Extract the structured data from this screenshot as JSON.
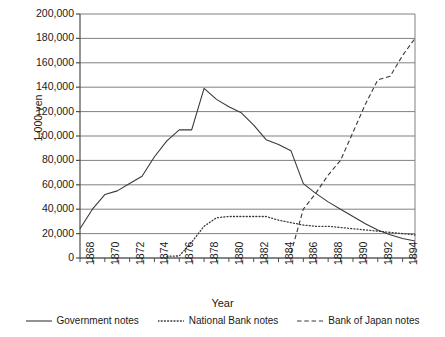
{
  "chart_data": {
    "type": "line",
    "title": "",
    "xlabel": "Year",
    "ylabel": "1,000 yen",
    "xlim": [
      1868,
      1895
    ],
    "ylim": [
      0,
      200000
    ],
    "ytick_labels": [
      "200,000",
      "180,000",
      "160,000",
      "140,000",
      "120,000",
      "100,000",
      "80,000",
      "60,000",
      "40,000",
      "20,000",
      "0"
    ],
    "ytick_values": [
      200000,
      180000,
      160000,
      140000,
      120000,
      100000,
      80000,
      60000,
      40000,
      20000,
      0
    ],
    "xtick_labels": [
      "1868",
      "1870",
      "1872",
      "1874",
      "1876",
      "1878",
      "1880",
      "1882",
      "1884",
      "1886",
      "1888",
      "1890",
      "1892",
      "1894"
    ],
    "xtick_values": [
      1868,
      1870,
      1872,
      1874,
      1876,
      1878,
      1880,
      1882,
      1884,
      1886,
      1888,
      1890,
      1892,
      1894
    ],
    "grid": "horizontal",
    "legend_position": "bottom",
    "x": [
      1868,
      1869,
      1870,
      1871,
      1872,
      1873,
      1874,
      1875,
      1876,
      1877,
      1878,
      1879,
      1880,
      1881,
      1882,
      1883,
      1884,
      1885,
      1886,
      1887,
      1888,
      1889,
      1890,
      1891,
      1892,
      1893,
      1894,
      1895
    ],
    "series": [
      {
        "name": "Government notes",
        "style": "solid",
        "color": "#3a3a3a",
        "values": [
          24000,
          40000,
          52000,
          55000,
          61000,
          67000,
          83000,
          96000,
          105000,
          105000,
          139000,
          130000,
          124000,
          119000,
          109000,
          97000,
          93000,
          88000,
          61000,
          53000,
          46000,
          40000,
          34000,
          28000,
          23000,
          19000,
          16000,
          14000
        ]
      },
      {
        "name": "National Bank notes",
        "style": "dotted",
        "color": "#3a3a3a",
        "values": [
          null,
          null,
          null,
          null,
          null,
          null,
          null,
          1400,
          1700,
          13000,
          26000,
          33000,
          34000,
          34000,
          34000,
          34000,
          31000,
          29000,
          27000,
          26000,
          26000,
          25000,
          24000,
          23000,
          22000,
          21000,
          20000,
          19000
        ]
      },
      {
        "name": "Bank of Japan notes",
        "style": "dashed",
        "color": "#3a3a3a",
        "values": [
          null,
          null,
          null,
          null,
          null,
          null,
          null,
          null,
          null,
          null,
          null,
          null,
          null,
          null,
          null,
          null,
          null,
          4000,
          40000,
          53000,
          68000,
          80000,
          103000,
          126000,
          146000,
          149000,
          166000,
          180000
        ]
      }
    ]
  },
  "legend": [
    {
      "label": "Government notes",
      "style": "solid"
    },
    {
      "label": "National Bank notes",
      "style": "dotted"
    },
    {
      "label": "Bank of Japan notes",
      "style": "dashed"
    }
  ],
  "axis_titles": {
    "x": "Year",
    "y": "1,000 yen"
  }
}
